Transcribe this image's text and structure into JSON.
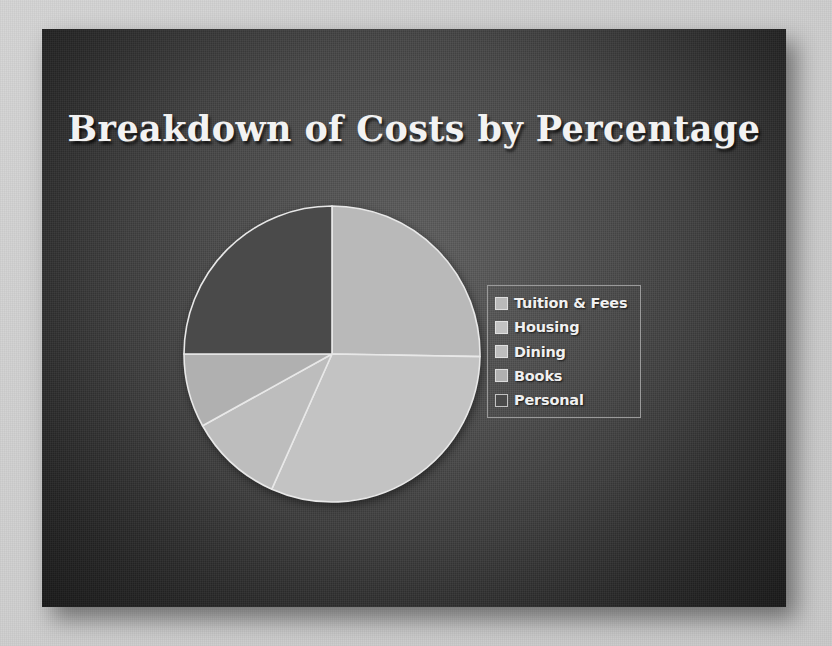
{
  "slide": {
    "title": "Breakdown of Costs by Percentage",
    "background_color": "#3d3d3d",
    "title_color": "#f2f2f2",
    "canvas_color": "#d0d0d0"
  },
  "legend": {
    "position": "right",
    "border_color": "#9a9a9a",
    "items": [
      {
        "label": "Tuition & Fees",
        "color": "#b9b9b9"
      },
      {
        "label": "Housing",
        "color": "#c3c3c3"
      },
      {
        "label": "Dining",
        "color": "#bdbdbd"
      },
      {
        "label": "Books",
        "color": "#b0b0b0"
      },
      {
        "label": "Personal",
        "color": "#4a4a4a"
      }
    ]
  },
  "chart_data": {
    "type": "pie",
    "title": "Breakdown of Costs by Percentage",
    "xlabel": "",
    "ylabel": "",
    "legend_position": "right",
    "grid": false,
    "start_angle_deg": 0,
    "direction": "clockwise",
    "categories": [
      "Tuition & Fees",
      "Housing",
      "Dining",
      "Books",
      "Personal"
    ],
    "values": [
      25,
      31,
      10,
      8,
      25
    ],
    "units": "percent",
    "slices": [
      {
        "name": "Tuition & Fees",
        "value": 25,
        "start_deg": 0,
        "end_deg": 91,
        "color": "#b9b9b9"
      },
      {
        "name": "Housing",
        "value": 31,
        "start_deg": 91,
        "end_deg": 204,
        "color": "#c3c3c3"
      },
      {
        "name": "Dining",
        "value": 10,
        "start_deg": 204,
        "end_deg": 241,
        "color": "#bdbdbd"
      },
      {
        "name": "Books",
        "value": 8,
        "start_deg": 241,
        "end_deg": 270,
        "color": "#b0b0b0"
      },
      {
        "name": "Personal",
        "value": 25,
        "start_deg": 270,
        "end_deg": 360,
        "color": "#4a4a4a"
      }
    ]
  }
}
